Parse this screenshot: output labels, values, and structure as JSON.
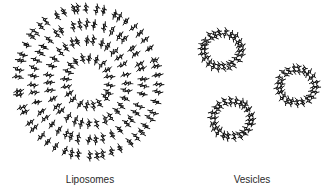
{
  "figure": {
    "background": "#ffffff",
    "ink_color": "#111111",
    "liposome": {
      "label": "Liposomes",
      "label_pos": [
        90,
        174
      ],
      "center": [
        88,
        82
      ],
      "tilt_deg": -15,
      "rings": [
        {
          "rx": 70,
          "ry": 74,
          "count": 52
        },
        {
          "rx": 55,
          "ry": 58,
          "count": 42
        },
        {
          "rx": 39,
          "ry": 42,
          "count": 32
        },
        {
          "rx": 22,
          "ry": 24,
          "count": 20
        }
      ]
    },
    "vesicles": {
      "label": "Vesicles",
      "label_pos": [
        252,
        174
      ],
      "items": [
        {
          "name": "vesicle-top-left",
          "center": [
            222,
            50
          ],
          "rx": 22,
          "ry": 20,
          "count": 22
        },
        {
          "name": "vesicle-right",
          "center": [
            297,
            86
          ],
          "rx": 21,
          "ry": 20,
          "count": 21
        },
        {
          "name": "vesicle-bottom",
          "center": [
            232,
            119
          ],
          "rx": 22,
          "ry": 21,
          "count": 22
        }
      ]
    }
  }
}
